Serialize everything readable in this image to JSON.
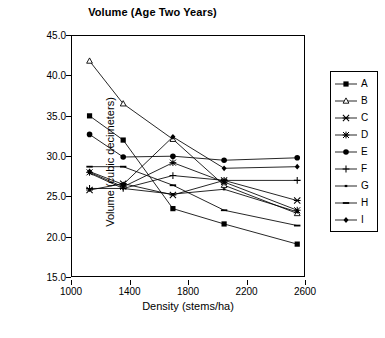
{
  "chart_data": {
    "type": "line",
    "title": "Volume (Age Two Years)",
    "xlabel": "Density (stems/ha)",
    "ylabel": "Volume (cubic decimeters)",
    "xlim": [
      1000,
      2600
    ],
    "ylim": [
      15.0,
      45.0
    ],
    "xticks": [
      1000,
      1400,
      1800,
      2200,
      2600
    ],
    "xtick_labels": [
      "1000",
      "1400",
      "1800",
      "2200",
      "2600"
    ],
    "yticks": [
      15.0,
      20.0,
      25.0,
      30.0,
      35.0,
      40.0,
      45.0
    ],
    "ytick_labels": [
      "15.0",
      "20.0",
      "25.0",
      "30.0",
      "35.0",
      "40.0",
      "45.0"
    ],
    "grid": false,
    "legend_position": "right",
    "x": [
      1120,
      1350,
      1690,
      2040,
      2540
    ],
    "series": [
      {
        "name": "A",
        "marker": "filled-square",
        "values": [
          35.1,
          32.1,
          23.6,
          21.7,
          19.2
        ]
      },
      {
        "name": "B",
        "marker": "open-triangle",
        "values": [
          41.9,
          36.6,
          32.2,
          26.5,
          23.0
        ]
      },
      {
        "name": "C",
        "marker": "star-cross",
        "values": [
          25.9,
          26.7,
          25.3,
          27.1,
          24.6
        ]
      },
      {
        "name": "D",
        "marker": "filled-star",
        "values": [
          28.1,
          26.3,
          29.3,
          26.9,
          23.4
        ]
      },
      {
        "name": "E",
        "marker": "filled-circle",
        "values": [
          32.8,
          30.0,
          30.1,
          29.6,
          29.9
        ]
      },
      {
        "name": "F",
        "marker": "plus",
        "values": [
          26.1,
          26.1,
          27.7,
          27.1,
          27.1
        ]
      },
      {
        "name": "G",
        "marker": "small-dash",
        "values": [
          28.0,
          26.1,
          25.4,
          26.0,
          23.2
        ]
      },
      {
        "name": "H",
        "marker": "dash",
        "values": [
          28.8,
          28.8,
          26.5,
          23.4,
          21.5
        ]
      },
      {
        "name": "I",
        "marker": "small-diamond",
        "values": [
          28.2,
          26.6,
          32.5,
          28.6,
          28.8
        ]
      }
    ]
  },
  "legend": {
    "items": [
      {
        "label": "A"
      },
      {
        "label": "B"
      },
      {
        "label": "C"
      },
      {
        "label": "D"
      },
      {
        "label": "E"
      },
      {
        "label": "F"
      },
      {
        "label": "G"
      },
      {
        "label": "H"
      },
      {
        "label": "I"
      }
    ]
  },
  "colors": {
    "line": "#000000",
    "axis": "#000000",
    "background": "#ffffff"
  }
}
